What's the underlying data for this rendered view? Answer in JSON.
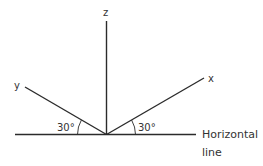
{
  "diagram": {
    "axes": {
      "z": {
        "label": "z"
      },
      "x": {
        "label": "x"
      },
      "y": {
        "label": "y"
      }
    },
    "angles": {
      "left": {
        "label": "30°"
      },
      "right": {
        "label": "30°"
      }
    },
    "horizontal_line": {
      "label_line1": "Horizontal",
      "label_line2": "line"
    },
    "colors": {
      "line": "#2b2b2b",
      "text": "#333333",
      "background": "#ffffff"
    }
  }
}
